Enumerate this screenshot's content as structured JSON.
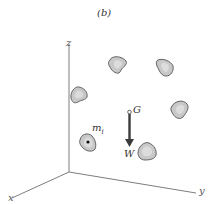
{
  "figure": {
    "panel_label": "(b)",
    "axes": {
      "x_label": "x",
      "y_label": "y",
      "z_label": "z"
    },
    "center_of_gravity_label": "G",
    "weight_label": "W",
    "particle_label": "m",
    "particle_subscript": "i",
    "colors": {
      "axis": "#6e6e6e",
      "blob_fill": "#c8c8c8",
      "blob_inner": "#dcdcdc",
      "blob_stroke": "#555555",
      "arrow": "#3a3a3a"
    }
  }
}
